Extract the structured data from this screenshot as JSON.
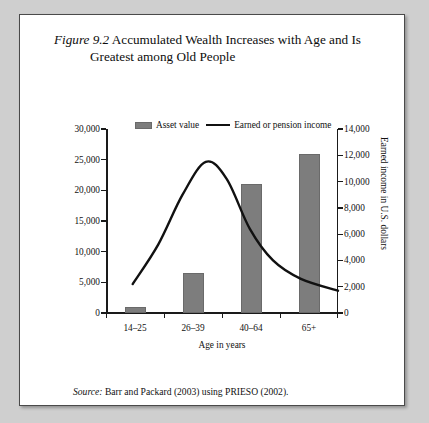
{
  "figure": {
    "number_label": "Figure 9.2",
    "title_line1": "Accumulated Wealth Increases with Age and Is",
    "title_line2": "Greatest among Old People",
    "source_prefix": "Source:",
    "source_text": "Barr and Packard (2003) using PRIESO (2002)."
  },
  "legend": {
    "bar_label": "Asset value",
    "line_label": "Earned or pension income"
  },
  "colors": {
    "bar_fill": "#7d7d7d",
    "line": "#111111",
    "axis": "#1a1a1a",
    "page_background": "#cfcfcf",
    "figure_background": "#ffffff"
  },
  "chart_data": {
    "type": "bar",
    "title": "Figure 9.2 Accumulated Wealth Increases with Age and Is Greatest among Old People",
    "categories": [
      "14–25",
      "26–39",
      "40–64",
      "65+"
    ],
    "xlabel": "Age in years",
    "ylabel": "Asset value in U.S. dollars",
    "y2label": "Earned income in U.S. dollars",
    "ylim": [
      0,
      30000
    ],
    "y2lim": [
      0,
      14000
    ],
    "yticks": [
      0,
      5000,
      10000,
      15000,
      20000,
      25000,
      30000
    ],
    "ytick_labels": [
      "0",
      "5,000",
      "10,000",
      "15,000",
      "20,000",
      "25,000",
      "30,000"
    ],
    "y2ticks": [
      0,
      2000,
      4000,
      6000,
      8000,
      10000,
      12000,
      14000
    ],
    "y2tick_labels": [
      "0",
      "2,000",
      "4,000",
      "6,000",
      "8,000",
      "10,000",
      "12,000",
      "14,000"
    ],
    "grid": false,
    "legend_position": "top-center",
    "series": [
      {
        "name": "Asset value",
        "type": "bar",
        "axis": "left",
        "values": [
          1000,
          6500,
          21000,
          26000
        ]
      },
      {
        "name": "Earned or pension income",
        "type": "line",
        "axis": "right",
        "x_fraction": [
          0.11,
          0.42,
          0.72,
          1.0
        ],
        "values": [
          2200,
          11500,
          4000,
          1700
        ],
        "curve_points": [
          {
            "x_frac": 0.115,
            "value": 2200
          },
          {
            "x_frac": 0.225,
            "value": 5200
          },
          {
            "x_frac": 0.33,
            "value": 9000
          },
          {
            "x_frac": 0.43,
            "value": 11500
          },
          {
            "x_frac": 0.52,
            "value": 10200
          },
          {
            "x_frac": 0.62,
            "value": 6400
          },
          {
            "x_frac": 0.72,
            "value": 4000
          },
          {
            "x_frac": 0.84,
            "value": 2600
          },
          {
            "x_frac": 1.0,
            "value": 1700
          }
        ]
      }
    ]
  }
}
